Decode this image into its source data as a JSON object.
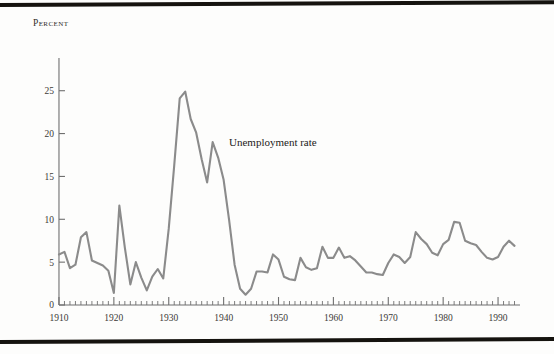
{
  "figure": {
    "y_axis_title": "Percent",
    "series_annotation": "Unemployment rate",
    "line_color": "#8b8b8b",
    "axis_color": "#6f6f6f",
    "rule_color": "#15130f"
  },
  "chart_data": {
    "type": "line",
    "title": "",
    "subtitle": "",
    "xlabel": "",
    "ylabel": "Percent",
    "grid": false,
    "legend_position": "inline-annotation",
    "annotations": [
      {
        "text": "Unemployment rate",
        "x": 1937,
        "y": 19.5
      }
    ],
    "xlim": [
      1908,
      1994
    ],
    "ylim": [
      0,
      28
    ],
    "xticks": [
      1910,
      1920,
      1930,
      1940,
      1950,
      1960,
      1970,
      1980,
      1990
    ],
    "xtick_labels": [
      "1910",
      "1920",
      "1930",
      "1940",
      "1950",
      "1960",
      "1970",
      "1980",
      "1990"
    ],
    "xtick_minor_step": 1,
    "yticks": [
      0,
      5,
      10,
      15,
      20,
      25
    ],
    "ytick_labels": [
      "0",
      "5",
      "10",
      "15",
      "20",
      "25"
    ],
    "series": [
      {
        "name": "Unemployment rate",
        "color": "#8b8b8b",
        "x": [
          1910,
          1911,
          1912,
          1913,
          1914,
          1915,
          1916,
          1917,
          1918,
          1919,
          1920,
          1921,
          1922,
          1923,
          1924,
          1925,
          1926,
          1927,
          1928,
          1929,
          1930,
          1931,
          1932,
          1933,
          1934,
          1935,
          1936,
          1937,
          1938,
          1939,
          1940,
          1941,
          1942,
          1943,
          1944,
          1945,
          1946,
          1947,
          1948,
          1949,
          1950,
          1951,
          1952,
          1953,
          1954,
          1955,
          1956,
          1957,
          1958,
          1959,
          1960,
          1961,
          1962,
          1963,
          1964,
          1965,
          1966,
          1967,
          1968,
          1969,
          1970,
          1971,
          1972,
          1973,
          1974,
          1975,
          1976,
          1977,
          1978,
          1979,
          1980,
          1981,
          1982,
          1983,
          1984,
          1985,
          1986,
          1987,
          1988,
          1989,
          1990,
          1991,
          1992,
          1993
        ],
        "values": [
          5.9,
          6.2,
          4.3,
          4.7,
          7.9,
          8.5,
          5.2,
          4.9,
          4.6,
          4.0,
          1.4,
          11.6,
          6.7,
          2.4,
          5.0,
          3.2,
          1.7,
          3.3,
          4.2,
          3.1,
          8.9,
          16.3,
          24.1,
          24.9,
          21.7,
          20.1,
          17.0,
          14.3,
          19.0,
          17.2,
          14.6,
          9.9,
          4.7,
          1.9,
          1.2,
          1.9,
          3.9,
          3.9,
          3.8,
          5.9,
          5.3,
          3.3,
          3.0,
          2.9,
          5.5,
          4.4,
          4.1,
          4.3,
          6.8,
          5.5,
          5.5,
          6.7,
          5.5,
          5.7,
          5.2,
          4.5,
          3.8,
          3.8,
          3.6,
          3.5,
          4.9,
          5.9,
          5.6,
          4.9,
          5.6,
          8.5,
          7.7,
          7.1,
          6.1,
          5.8,
          7.1,
          7.6,
          9.7,
          9.6,
          7.5,
          7.2,
          7.0,
          6.2,
          5.5,
          5.3,
          5.6,
          6.8,
          7.5,
          6.9
        ]
      }
    ]
  }
}
